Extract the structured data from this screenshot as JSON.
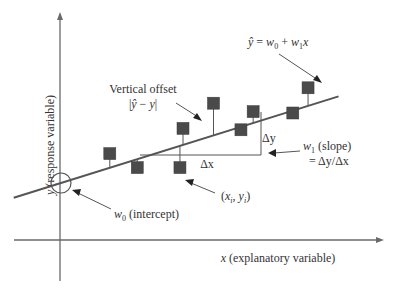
{
  "axes": {
    "x_label_var": "x",
    "x_label_text": " (explanatory variable)",
    "y_label_var": "y",
    "y_label_text": " (response variable)"
  },
  "annotations": {
    "equation": {
      "yhat": "ŷ",
      "eq": " = ",
      "w0": "w",
      "w0_sub": "0",
      "plus": " + ",
      "w1": "w",
      "w1_sub": "1",
      "x": "x"
    },
    "vertical_offset": {
      "line1": "Vertical offset",
      "line2_open": "|",
      "line2_yhat": "ŷ",
      "line2_minus": " − ",
      "line2_y": "y",
      "line2_close": "|"
    },
    "delta_y": "Δy",
    "delta_x": "Δx",
    "slope": {
      "w": "w",
      "sub": "1",
      "text": " (slope)",
      "line2": "= Δy/Δx"
    },
    "point": {
      "open": "(",
      "x": "x",
      "xsub": "i",
      "comma": ", ",
      "y": "y",
      "ysub": "i",
      "close": ")"
    },
    "intercept": {
      "w": "w",
      "sub": "0",
      "text": " (intercept)"
    }
  },
  "colors": {
    "axis": "#6a6a6a",
    "line": "#555555",
    "point": "#4a4a4a",
    "text": "#333333"
  },
  "chart_data": {
    "type": "scatter",
    "title": "",
    "xlabel": "x (explanatory variable)",
    "ylabel": "y (response variable)",
    "regression_line": {
      "intercept": 0,
      "slope": 0.34
    },
    "points": [
      {
        "x": 1.6,
        "y": 1.05
      },
      {
        "x": 2.5,
        "y": 0.55
      },
      {
        "x": 3.9,
        "y": 0.55
      },
      {
        "x": 4.0,
        "y": 1.95
      },
      {
        "x": 5.0,
        "y": 2.85
      },
      {
        "x": 5.9,
        "y": 1.9
      },
      {
        "x": 6.3,
        "y": 2.55
      },
      {
        "x": 7.6,
        "y": 2.5
      },
      {
        "x": 8.1,
        "y": 3.4
      }
    ],
    "xlim": [
      -1,
      11.5
    ],
    "ylim": [
      -3.5,
      9
    ]
  }
}
